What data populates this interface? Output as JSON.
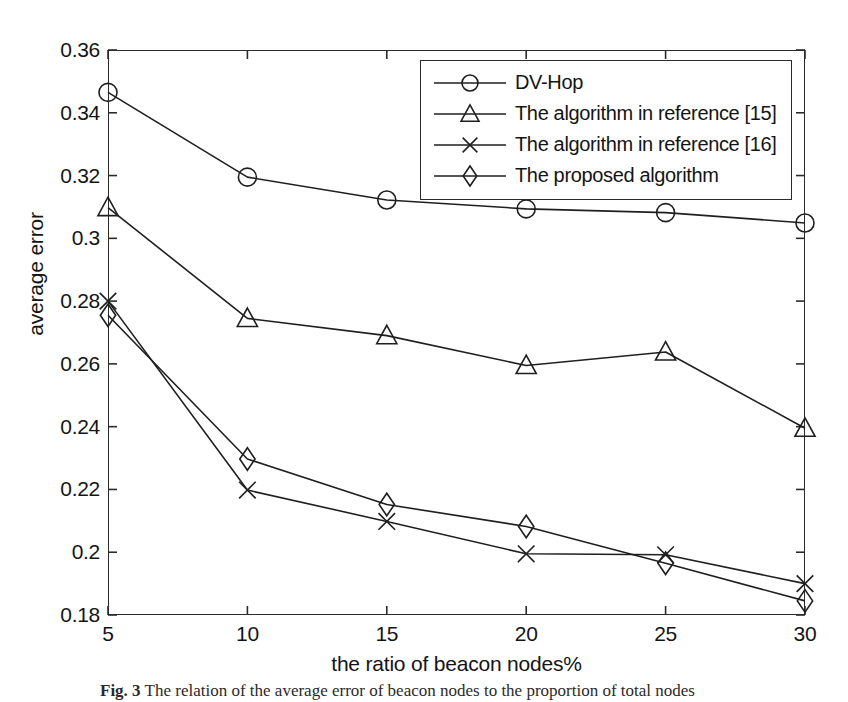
{
  "figure": {
    "caption_label": "Fig. 3",
    "caption_text": "The relation of the average error of beacon nodes to the proportion of total nodes"
  },
  "axes": {
    "xlabel": "the ratio of beacon nodes%",
    "ylabel": "average error",
    "xticks": [
      "5",
      "10",
      "15",
      "20",
      "25",
      "30"
    ],
    "yticks": [
      "0.18",
      "0.2",
      "0.22",
      "0.24",
      "0.26",
      "0.28",
      "0.3",
      "0.32",
      "0.34",
      "0.36"
    ]
  },
  "legend": {
    "position": "top-right",
    "items": [
      {
        "label": "DV-Hop",
        "marker": "circle-marker"
      },
      {
        "label": "The algorithm in reference [15]",
        "marker": "triangle-marker"
      },
      {
        "label": "The algorithm in reference [16]",
        "marker": "cross-marker"
      },
      {
        "label": "The proposed algorithm",
        "marker": "diamond-marker"
      }
    ]
  },
  "colors": {
    "line": "#1f1f1f",
    "frame": "#2b2b2b",
    "background": "#ffffff"
  },
  "chart_data": {
    "type": "line",
    "title": "",
    "xlabel": "the ratio of beacon nodes%",
    "ylabel": "average error",
    "x": [
      5,
      10,
      15,
      20,
      25,
      30
    ],
    "xlim": [
      5,
      30
    ],
    "ylim": [
      0.18,
      0.36
    ],
    "ytick_step": 0.02,
    "grid": false,
    "legend_position": "upper right",
    "series": [
      {
        "name": "DV-Hop",
        "marker": "circle",
        "values": [
          0.3465,
          0.3195,
          0.3122,
          0.3094,
          0.3082,
          0.3049
        ]
      },
      {
        "name": "The algorithm in reference [15]",
        "marker": "triangle",
        "values": [
          0.3098,
          0.2745,
          0.269,
          0.2595,
          0.2638,
          0.2395
        ]
      },
      {
        "name": "The algorithm in reference [16]",
        "marker": "cross",
        "values": [
          0.28,
          0.2198,
          0.2098,
          0.1995,
          0.1992,
          0.19
        ]
      },
      {
        "name": "The proposed algorithm",
        "marker": "diamond",
        "values": [
          0.2755,
          0.2297,
          0.2152,
          0.2082,
          0.1965,
          0.1845
        ]
      }
    ]
  }
}
